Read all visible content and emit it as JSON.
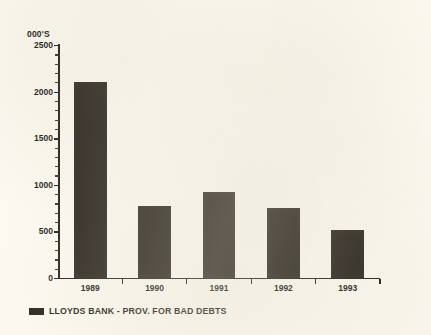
{
  "chart_data": {
    "type": "bar",
    "title": "",
    "subtitle": "",
    "unit_caption": "000'S",
    "xlabel": "",
    "ylabel": "",
    "categories": [
      "1989",
      "1990",
      "1991",
      "1992",
      "1993"
    ],
    "values": [
      2100,
      770,
      920,
      750,
      510
    ],
    "series": [
      {
        "name": "LLOYDS BANK - PROV. FOR BAD DEBTS",
        "values": [
          2100,
          770,
          920,
          750,
          510
        ],
        "color": "#1b1610"
      }
    ],
    "ylim": [
      0,
      2500
    ],
    "y_ticks": [
      0,
      500,
      1000,
      1500,
      2000,
      2500
    ],
    "y_tick_labels": [
      "0",
      "500",
      "1000",
      "1500",
      "2000",
      "2500"
    ],
    "y_minor_tick_step": 100,
    "grid": false,
    "legend": {
      "position": "below-left",
      "entries": [
        {
          "label": "LLOYDS BANK - PROV. FOR BAD DEBTS",
          "color": "#1b1610"
        }
      ]
    },
    "bar_color": "#1b1610",
    "background_color": "#fdfbf2",
    "axis_color": "#15120e"
  }
}
